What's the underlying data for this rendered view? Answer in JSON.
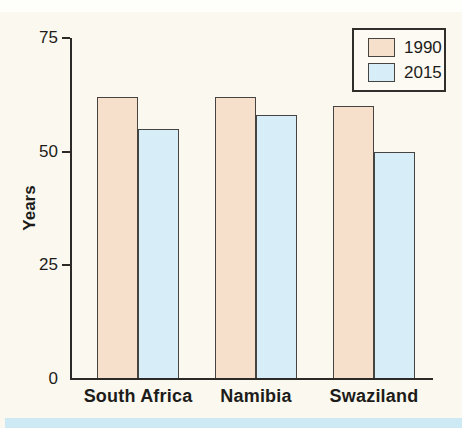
{
  "figure": {
    "background": "#fbf9ef",
    "bottom_strip_color": "#cde9f4"
  },
  "chart_data": {
    "type": "bar",
    "title": "",
    "xlabel": "",
    "ylabel": "Years",
    "categories": [
      "South Africa",
      "Namibia",
      "Swaziland"
    ],
    "series": [
      {
        "name": "1990",
        "color": "#f6e0cb",
        "values": [
          62,
          62,
          60
        ]
      },
      {
        "name": "2015",
        "color": "#d7eef8",
        "values": [
          55,
          58,
          50
        ]
      }
    ],
    "ylim": [
      0,
      75
    ],
    "yticks": [
      0,
      25,
      50,
      75
    ],
    "grid": false,
    "legend_position": "top-right",
    "bar_outline_color": "#454440",
    "axis_color": "#2b2a27",
    "text_color": "#1d1c1a"
  }
}
